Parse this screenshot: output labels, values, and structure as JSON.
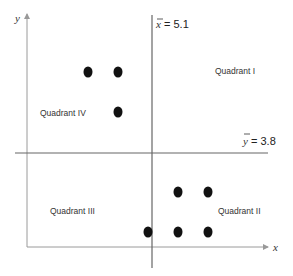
{
  "diagram": {
    "axes": {
      "x_label": "x",
      "y_label": "y"
    },
    "mean_lines": {
      "x_bar": {
        "symbol": "x",
        "label": "= 5.1"
      },
      "y_bar": {
        "symbol": "y",
        "label": "= 3.8"
      }
    },
    "quadrants": [
      {
        "id": "I",
        "label": "Quadrant I"
      },
      {
        "id": "II",
        "label": "Quadrant II"
      },
      {
        "id": "III",
        "label": "Quadrant III"
      },
      {
        "id": "IV",
        "label": "Quadrant IV"
      }
    ],
    "points": [
      {
        "quadrant": "IV",
        "cx": 88,
        "cy": 72
      },
      {
        "quadrant": "IV",
        "cx": 118,
        "cy": 72
      },
      {
        "quadrant": "IV",
        "cx": 118,
        "cy": 112
      },
      {
        "quadrant": "II",
        "cx": 178,
        "cy": 192
      },
      {
        "quadrant": "II",
        "cx": 208,
        "cy": 192
      },
      {
        "quadrant": "II",
        "cx": 148,
        "cy": 232
      },
      {
        "quadrant": "II",
        "cx": 178,
        "cy": 232
      },
      {
        "quadrant": "II",
        "cx": 208,
        "cy": 232
      }
    ],
    "colors": {
      "axis": "#999999",
      "mean_line": "#555555",
      "point": "#111111"
    }
  }
}
